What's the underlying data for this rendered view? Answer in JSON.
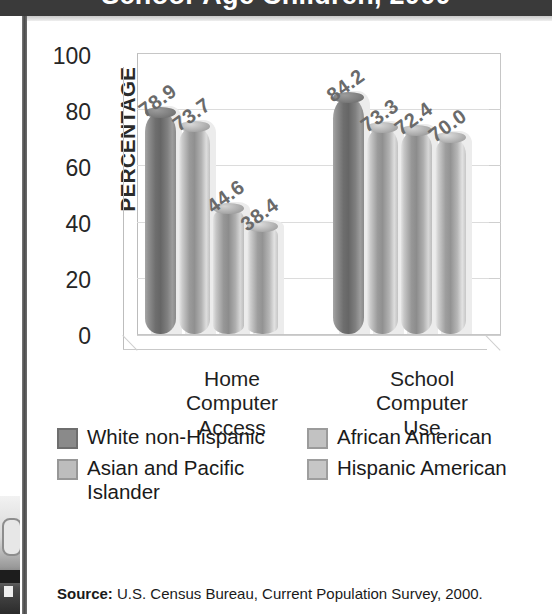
{
  "page": {
    "title_band_text": "School-Age Children, 2000",
    "source_label": "Source:",
    "source_text": "U.S. Census Bureau, Current Population Survey, 2000."
  },
  "colors": {
    "series_1": "#8a8a8a",
    "series_2": "#c2c2c2",
    "series_3": "#bdbdbd",
    "series_4": "#c6c6c6",
    "axis": "#c6c6c6",
    "grid": "#dcdcdc",
    "label_text": "#6a6a6a",
    "title_band": "#3a3a3a"
  },
  "chart_data": {
    "type": "bar",
    "title": "School-Age Children, 2000",
    "xlabel": "",
    "ylabel": "PERCENTAGE",
    "ylim": [
      0,
      100
    ],
    "yticks": [
      "0",
      "20",
      "40",
      "60",
      "80",
      "100"
    ],
    "grid": true,
    "legend_position": "bottom",
    "categories": [
      "Home Computer Access",
      "School Computer Use"
    ],
    "category_lines": [
      [
        "Home",
        "Computer",
        "Access"
      ],
      [
        "School",
        "Computer",
        "Use"
      ]
    ],
    "series": [
      {
        "name": "White non-Hispanic",
        "values": [
          78.9,
          84.2
        ],
        "labels": [
          "78.9",
          "84.2"
        ]
      },
      {
        "name": "African American",
        "values": [
          73.7,
          73.3
        ],
        "labels": [
          "73.7",
          "73.3"
        ]
      },
      {
        "name": "Asian and Pacific Islander",
        "values": [
          44.6,
          72.4
        ],
        "labels": [
          "44.6",
          "72.4"
        ]
      },
      {
        "name": "Hispanic American",
        "values": [
          38.4,
          70.0
        ],
        "labels": [
          "38.4",
          "70.0"
        ]
      }
    ]
  },
  "legend": {
    "entries": [
      {
        "label": "White non-Hispanic"
      },
      {
        "label": "African American"
      },
      {
        "label": "Asian and Pacific Islander"
      },
      {
        "label": "Hispanic American"
      }
    ]
  }
}
